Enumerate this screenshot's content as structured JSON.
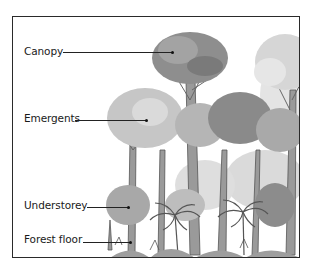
{
  "diagram": {
    "type": "rainforest-layers-illustration",
    "labels": [
      {
        "id": "canopy",
        "text": "Canopy"
      },
      {
        "id": "emergents",
        "text": "Emergents"
      },
      {
        "id": "understorey",
        "text": "Understorey"
      },
      {
        "id": "forest-floor",
        "text": "Forest floor"
      }
    ]
  }
}
